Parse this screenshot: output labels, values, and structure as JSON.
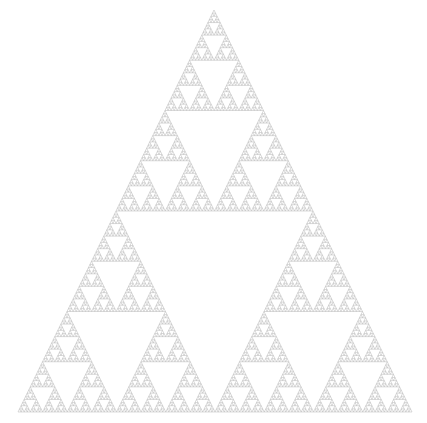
{
  "figure": {
    "kind": "Sierpinski triangle",
    "background": "#ffffff",
    "stroke_color": "#b4b4b4",
    "apex": [
      214,
      10
    ],
    "left_base": [
      18,
      412
    ],
    "right_base": [
      412,
      412
    ],
    "depth": 7
  }
}
